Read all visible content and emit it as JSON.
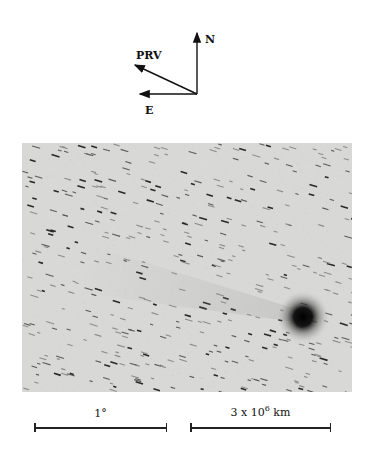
{
  "compass": {
    "north_label": "N",
    "east_label": "E",
    "prv_label": "PRV"
  },
  "image": {
    "description": "Negative (inverted) grayscale telescope image of a comet with trailed star field",
    "background_color": "#d8d8d6",
    "nucleus": {
      "x": 281,
      "y": 174,
      "radius": 12
    }
  },
  "scale_bars": [
    {
      "label": "1°",
      "length_px": 133
    },
    {
      "label_base": "3 x 10",
      "label_exp": "6",
      "label_unit": "km",
      "length_px": 141
    }
  ]
}
